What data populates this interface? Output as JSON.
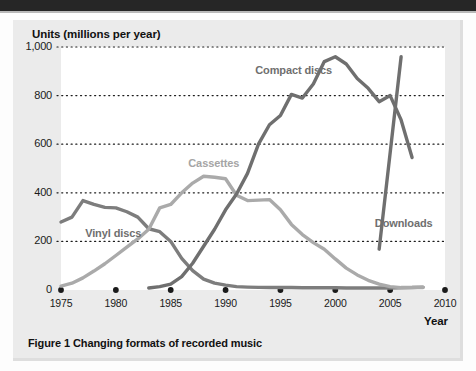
{
  "figure": {
    "caption": "Figure 1 Changing formats of recorded music",
    "panel_background": "#ebebeb",
    "plot_background": "#ffffff",
    "top_band_color": "#262626"
  },
  "chart_data": {
    "type": "line",
    "title": "Figure 1 Changing formats of recorded music",
    "xlabel": "Year",
    "ylabel": "Units (millions per year)",
    "xlim": [
      1975,
      2010
    ],
    "ylim": [
      0,
      1000
    ],
    "xticks": [
      1975,
      1980,
      1985,
      1990,
      1995,
      2000,
      2005,
      2010
    ],
    "xtick_labels": [
      "1975",
      "1980",
      "1985",
      "1990",
      "1995",
      "2000",
      "2005",
      "2010"
    ],
    "yticks": [
      0,
      200,
      400,
      600,
      800,
      1000
    ],
    "ytick_labels": [
      "0",
      "200",
      "400",
      "600",
      "800",
      "1,000"
    ],
    "grid": "horizontal-dotted",
    "legend": "inline-annotations",
    "series": [
      {
        "name": "Vinyl discs",
        "color": "#7d7d7d",
        "label_x": 1977.2,
        "label_y": 232,
        "x": [
          1975,
          1976,
          1977,
          1978,
          1979,
          1980,
          1981,
          1982,
          1983,
          1984,
          1985,
          1986,
          1987,
          1988,
          1989,
          1990,
          1991,
          1992,
          1993,
          1994,
          1995,
          1996,
          1997,
          1998,
          1999,
          2000,
          2001,
          2002,
          2003,
          2004,
          2005,
          2006,
          2007,
          2008
        ],
        "y": [
          280,
          300,
          368,
          352,
          340,
          338,
          322,
          300,
          252,
          240,
          200,
          130,
          80,
          45,
          28,
          20,
          14,
          12,
          11,
          10,
          10,
          10,
          9,
          9,
          9,
          9,
          8,
          8,
          8,
          8,
          8,
          9,
          10,
          12
        ]
      },
      {
        "name": "Cassettes",
        "color": "#aaaaaa",
        "label_x": 1986.6,
        "label_y": 520,
        "x": [
          1975,
          1976,
          1977,
          1978,
          1979,
          1980,
          1981,
          1982,
          1983,
          1984,
          1985,
          1986,
          1987,
          1988,
          1989,
          1990,
          1991,
          1992,
          1993,
          1994,
          1995,
          1996,
          1997,
          1998,
          1999,
          2000,
          2001,
          2002,
          2003,
          2004,
          2005,
          2006,
          2007,
          2008
        ],
        "y": [
          16,
          28,
          50,
          78,
          108,
          142,
          176,
          210,
          250,
          338,
          352,
          400,
          440,
          468,
          464,
          458,
          390,
          368,
          370,
          372,
          330,
          270,
          228,
          195,
          168,
          128,
          90,
          62,
          40,
          24,
          14,
          10,
          10,
          10
        ]
      },
      {
        "name": "Compact discs",
        "color": "#6f6f6f",
        "label_x": 1992.7,
        "label_y": 900,
        "x": [
          1983,
          1984,
          1985,
          1986,
          1987,
          1988,
          1989,
          1990,
          1991,
          1992,
          1993,
          1994,
          1995,
          1996,
          1997,
          1998,
          1999,
          2000,
          2001,
          2002,
          2003,
          2004,
          2005,
          2006,
          2007
        ],
        "y": [
          8,
          14,
          24,
          55,
          110,
          180,
          250,
          330,
          395,
          480,
          600,
          680,
          718,
          805,
          790,
          848,
          940,
          960,
          930,
          870,
          830,
          775,
          800,
          700,
          545
        ]
      },
      {
        "name": "Downloads",
        "color": "#6f6f6f",
        "label_x": 2003.6,
        "label_y": 270,
        "x": [
          2004,
          2006
        ],
        "y": [
          168,
          960
        ]
      }
    ],
    "x_baseline_markers": [
      1975,
      1980,
      1985,
      1990,
      1995,
      2000,
      2005,
      2010
    ]
  }
}
